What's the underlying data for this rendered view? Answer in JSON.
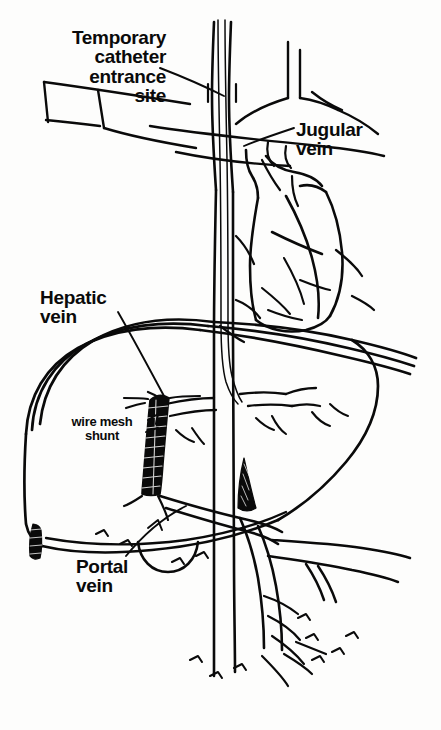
{
  "figure": {
    "background_color": "#fdfdfc",
    "ink_color": "#0a0a0a",
    "labels": {
      "temporary_catheter": "Temporary\ncatheter\nentrance\nsite",
      "jugular_vein": "Jugular\nvein",
      "hepatic_vein": "Hepatic\nvein",
      "wire_mesh_shunt": "wire mesh\nshunt",
      "portal_vein": "Portal\nvein"
    },
    "structures": [
      "jugular vein",
      "subclavian vein",
      "superior vena cava",
      "heart",
      "inferior vena cava",
      "liver",
      "hepatic vein",
      "portal vein",
      "splenic vein",
      "superior mesenteric vein",
      "gallbladder",
      "wire mesh shunt stent",
      "temporary catheter"
    ]
  }
}
